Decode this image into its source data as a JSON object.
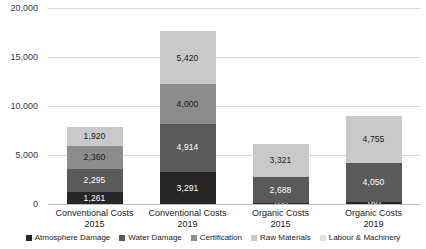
{
  "chart_data": {
    "type": "bar",
    "subtype": "stacked-column",
    "title": "",
    "xlabel": "",
    "ylabel": "",
    "ylim": [
      0,
      20000
    ],
    "ytick_labels": [
      "0",
      "5,000",
      "10,000",
      "15,000",
      "20,000"
    ],
    "ytick_values": [
      0,
      5000,
      10000,
      15000,
      20000
    ],
    "grid": true,
    "legend_position": "bottom",
    "categories": [
      {
        "line1": "Conventional Costs",
        "line2": "2015"
      },
      {
        "line1": "Conventional Costs",
        "line2": "2019"
      },
      {
        "line1": "Organic Costs",
        "line2": "2015"
      },
      {
        "line1": "Organic Costs",
        "line2": "2019"
      }
    ],
    "category_labels": [
      "Conventional Costs 2015",
      "Conventional Costs 2019",
      "Organic Costs 2015",
      "Organic Costs 2019"
    ],
    "series": [
      {
        "name": "Atmosphere Damage",
        "color": "#262626",
        "label_color": "#ffffff",
        "values": [
          1261,
          3291,
          100,
          160
        ],
        "value_labels": [
          "1,261",
          "3,291",
          "100",
          "160"
        ]
      },
      {
        "name": "Water Damage",
        "color": "#5a5a5a",
        "label_color": "#ffffff",
        "values": [
          2295,
          4914,
          2688,
          4050
        ],
        "value_labels": [
          "2,295",
          "4,914",
          "2,688",
          "4,050"
        ]
      },
      {
        "name": "Certification",
        "color": "#8c8c8c",
        "label_color": "#1a1a1a",
        "values": [
          2360,
          4000,
          0,
          0
        ],
        "value_labels": [
          "2,360",
          "4,000",
          "",
          ""
        ]
      },
      {
        "name": "Raw Materials",
        "color": "#c9c9c9",
        "label_color": "#1a1a1a",
        "values": [
          1920,
          5420,
          3321,
          4755
        ],
        "value_labels": [
          "1,920",
          "5,420",
          "3,321",
          "4,755"
        ]
      },
      {
        "name": "Labour & Machinery",
        "color": "#e3e3e3",
        "label_color": "#1a1a1a",
        "values": [
          0,
          0,
          0,
          0
        ],
        "value_labels": [
          "",
          "",
          "",
          ""
        ]
      }
    ],
    "totals": [
      7836,
      17625,
      6109,
      8965
    ]
  }
}
